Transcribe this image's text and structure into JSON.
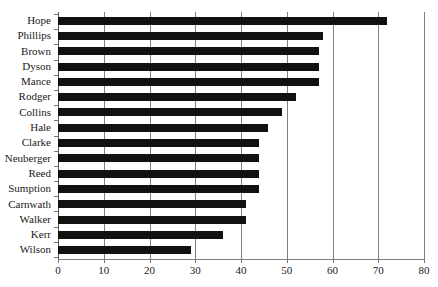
{
  "chart_data": {
    "type": "bar",
    "orientation": "horizontal",
    "title": "",
    "subtitle": "",
    "xlabel": "",
    "ylabel": "",
    "xlim": [
      0,
      80
    ],
    "xticks": [
      0,
      10,
      20,
      30,
      40,
      50,
      60,
      70,
      80
    ],
    "grid": "vertical",
    "legend": "none",
    "bar_color": "#111111",
    "categories": [
      "Hope",
      "Phillips",
      "Brown",
      "Dyson",
      "Mance",
      "Rodger",
      "Collins",
      "Hale",
      "Clarke",
      "Neuberger",
      "Reed",
      "Sumption",
      "Carnwath",
      "Walker",
      "Kerr",
      "Wilson"
    ],
    "values": [
      72,
      58,
      57,
      57,
      57,
      52,
      49,
      46,
      44,
      44,
      44,
      44,
      41,
      41,
      36,
      29
    ]
  }
}
